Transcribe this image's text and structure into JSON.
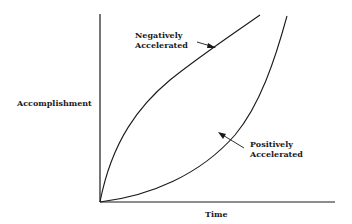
{
  "diagram": {
    "y_axis_label": "Accomplishment",
    "x_axis_label": "Time",
    "curves": [
      {
        "name": "negatively-accelerated",
        "label_line1": "Negatively",
        "label_line2": "Accelerated"
      },
      {
        "name": "positively-accelerated",
        "label_line1": "Positively",
        "label_line2": "Accelerated"
      }
    ],
    "colors": {
      "line": "#1a1a1a",
      "background": "#ffffff"
    }
  }
}
